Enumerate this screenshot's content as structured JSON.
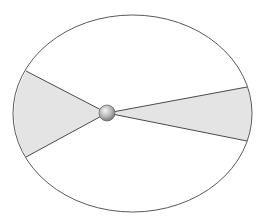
{
  "diagram": {
    "type": "kepler-second-law-equal-areas",
    "orbit": {
      "cx": 132.5,
      "cy": 113.5,
      "rx": 119.5,
      "ry": 98.5,
      "stroke": "#5a5a5a"
    },
    "sun": {
      "x": 107,
      "y": 113,
      "r": 8,
      "fill_light": "#e6e6e6",
      "fill_dark": "#7a7a7a"
    },
    "sectors": [
      {
        "name": "left-sector",
        "p1": [
          26,
          71
        ],
        "p2": [
          26,
          157
        ],
        "fill": "#e4e4e4"
      },
      {
        "name": "right-sector",
        "p1": [
          247,
          87
        ],
        "p2": [
          247,
          141
        ],
        "fill": "#e4e4e4"
      }
    ],
    "colors": {
      "background": "#ffffff",
      "line": "#4a4a4a",
      "sector_fill": "#e4e4e4"
    }
  }
}
